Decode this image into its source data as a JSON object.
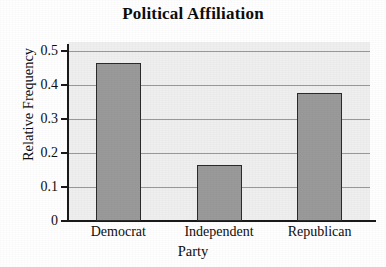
{
  "chart_data": {
    "type": "bar",
    "title": "Political Affiliation",
    "xlabel": "Party",
    "ylabel": "Relative Frequency",
    "categories": [
      "Democrat",
      "Independent",
      "Republican"
    ],
    "values": [
      0.465,
      0.165,
      0.377
    ],
    "ylim": [
      0,
      0.5
    ],
    "yticks": [
      0,
      0.1,
      0.2,
      0.3,
      0.4,
      0.5
    ],
    "ytick_labels": [
      "0",
      "0.1",
      "0.2",
      "0.3",
      "0.4",
      "0.5"
    ],
    "grid": "horizontal",
    "legend": "none",
    "colors": {
      "bar_fill": "#9a9a9a",
      "bar_edge": "#2b2b2b",
      "plot_background": "#efefef",
      "gridline": "#8a8a8a",
      "axis": "#1a1a1a",
      "text": "#0d0d0d",
      "figure_background": "#ffffff"
    }
  }
}
